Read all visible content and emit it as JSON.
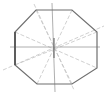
{
  "diagram": {
    "type": "octagon-with-symmetry-lines",
    "colors": {
      "background": "#ffffff",
      "outline": "#6f6f6f",
      "outline_dark": "#555555",
      "axis": "#9a9a9a",
      "dashed": "#c4c4c4"
    },
    "center": [
      54,
      47
    ],
    "octagon_points": "36,10 72,10 97,32 97,68 72,84 37,84 15,65 15,32",
    "axes": {
      "horizontal": {
        "x1": 10,
        "y1": 47,
        "x2": 100,
        "y2": 47
      },
      "vertical": {
        "x1": 52,
        "y1": 3,
        "x2": 55,
        "y2": 92
      }
    },
    "dashed_lines": [
      {
        "x1": 36,
        "y1": 10,
        "x2": 72,
        "y2": 84
      },
      {
        "x1": 72,
        "y1": 10,
        "x2": 37,
        "y2": 84
      },
      {
        "x1": 97,
        "y1": 32,
        "x2": 15,
        "y2": 65
      },
      {
        "x1": 15,
        "y1": 32,
        "x2": 97,
        "y2": 68
      },
      {
        "x1": 34,
        "y1": 4,
        "x2": 74,
        "y2": 90
      },
      {
        "x1": 3,
        "y1": 70,
        "x2": 104,
        "y2": 26
      }
    ]
  }
}
